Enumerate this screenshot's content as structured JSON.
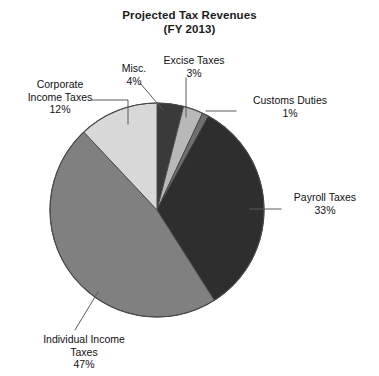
{
  "chart_data": {
    "type": "pie",
    "title": "Projected Tax Revenues",
    "subtitle": "(FY 2013)",
    "xlabel": "",
    "ylabel": "",
    "legend_position": "callouts",
    "grid": false,
    "units": "percent",
    "categories": [
      "Misc.",
      "Excise Taxes",
      "Customs Duties",
      "Payroll Taxes",
      "Individual Income Taxes",
      "Corporate Income Taxes"
    ],
    "values": [
      4,
      3,
      1,
      33,
      47,
      12
    ],
    "labels": [
      "Misc. 4%",
      "Excise Taxes 3%",
      "Customs Duties 1%",
      "Payroll Taxes 33%",
      "Individual Income Taxes 47%",
      "Corporate Income Taxes 12%"
    ],
    "slices": [
      {
        "name": "Misc.",
        "value": 4,
        "pct_label": "4%",
        "color": "#3a3a3a"
      },
      {
        "name": "Excise Taxes",
        "value": 3,
        "pct_label": "3%",
        "color": "#b8b8b8"
      },
      {
        "name": "Customs Duties",
        "value": 1,
        "pct_label": "1%",
        "color": "#6f6f6f"
      },
      {
        "name": "Payroll Taxes",
        "value": 33,
        "pct_label": "33%",
        "color": "#2e2e2e"
      },
      {
        "name": "Individual Income Taxes",
        "value": 47,
        "pct_label": "47%",
        "color": "#808080"
      },
      {
        "name": "Corporate Income Taxes",
        "value": 12,
        "pct_label": "12%",
        "color": "#d8d8d8"
      }
    ]
  },
  "title": {
    "line1": "Projected Tax Revenues",
    "line2": "(FY 2013)"
  },
  "callouts": {
    "corporate": {
      "name_line1": "Corporate",
      "name_line2": "Income Taxes",
      "pct": "12%"
    },
    "misc": {
      "name_line1": "Misc.",
      "pct": "4%"
    },
    "excise": {
      "name_line1": "Excise Taxes",
      "pct": "3%"
    },
    "customs": {
      "name_line1": "Customs Duties",
      "pct": "1%"
    },
    "payroll": {
      "name_line1": "Payroll  Taxes",
      "pct": "33%"
    },
    "individual": {
      "name_line1": "Individual Income",
      "name_line2": "Taxes",
      "pct": "47%"
    }
  },
  "colors": {
    "background": "#ffffff",
    "text": "#111111",
    "outline": "#4a4a4a",
    "leader": "#5a5a5a"
  }
}
